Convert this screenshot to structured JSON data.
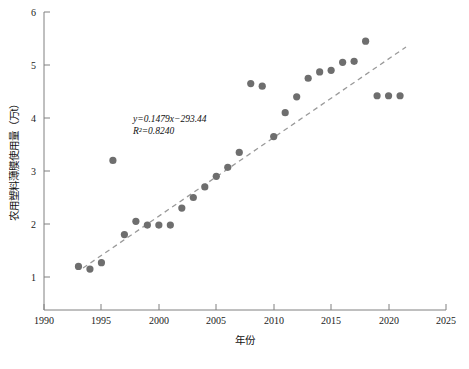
{
  "chart_data": {
    "type": "scatter",
    "title": "",
    "xlabel": "年份",
    "ylabel": "农用塑料薄膜使用量（万t）",
    "xlim": [
      1990,
      2025
    ],
    "ylim": [
      0.6,
      6
    ],
    "xticks": [
      1990,
      1995,
      2000,
      2005,
      2010,
      2015,
      2020,
      2025
    ],
    "yticks": [
      1,
      2,
      3,
      4,
      5,
      6
    ],
    "grid": false,
    "legend": "none",
    "x": [
      1993,
      1994,
      1995,
      1996,
      1997,
      1998,
      1999,
      2000,
      2001,
      2002,
      2003,
      2004,
      2005,
      2006,
      2007,
      2008,
      2009,
      2010,
      2011,
      2012,
      2013,
      2014,
      2015,
      2016,
      2017,
      2018,
      2019,
      2020,
      2021
    ],
    "values": [
      1.2,
      1.15,
      1.27,
      3.2,
      1.8,
      2.05,
      1.98,
      1.98,
      1.98,
      2.3,
      2.5,
      2.7,
      2.9,
      3.07,
      3.35,
      4.65,
      4.6,
      3.65,
      4.1,
      4.4,
      4.75,
      4.87,
      4.9,
      5.05,
      5.07,
      5.45,
      4.42,
      4.42,
      4.42
    ],
    "series_name": "农用塑料薄膜使用量",
    "marker": "circle",
    "marker_color": "#6e6e6e",
    "trendline": {
      "equation": "y=0.1479x−293.44",
      "r_squared": "R²=0.8240",
      "slope": 0.1479,
      "intercept": -293.44,
      "style": "dashed",
      "color": "#9a9a9a",
      "x_start": 1993.4,
      "x_end": 2018.3
    }
  },
  "annotations": {
    "equation_line1": "y=0.1479x−293.44",
    "equation_line2": "R²=0.8240"
  },
  "caption": {
    "text": "图  农用塑料薄膜使用量变化趋势"
  }
}
